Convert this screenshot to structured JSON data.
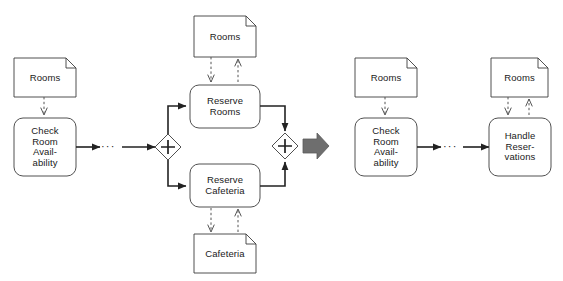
{
  "diagram": {
    "type": "bpmn-process-fragment",
    "title": "",
    "background_color": "#ffffff",
    "stroke_color": "#3c3c3c",
    "text_color": "#1a1a1a",
    "transition_arrow_color": "#6e6e6e",
    "panels": [
      {
        "id": "left-panel",
        "caption": ""
      },
      {
        "id": "right-panel",
        "caption": ""
      }
    ]
  },
  "left": {
    "documents": {
      "rooms_source": {
        "label": "Rooms",
        "name": "rooms-data-object"
      },
      "rooms_top": {
        "label": "Rooms",
        "name": "rooms-data-object"
      },
      "cafeteria_bottom": {
        "label": "Cafeteria",
        "name": "cafeteria-data-object"
      }
    },
    "tasks": {
      "check_room": {
        "label": "Check\nRoom\nAvail-\nability"
      },
      "reserve_rooms": {
        "label": "Reserve\nRooms"
      },
      "reserve_cafeteria": {
        "label": "Reserve\nCafeteria"
      }
    },
    "gateways": {
      "fork": {
        "symbol": "+",
        "kind": "parallel-fork"
      },
      "join": {
        "symbol": "+",
        "kind": "parallel-join"
      }
    },
    "ellipsis": {
      "label": "···"
    }
  },
  "right": {
    "documents": {
      "rooms_check": {
        "label": "Rooms",
        "name": "rooms-data-object"
      },
      "rooms_handle": {
        "label": "Rooms",
        "name": "rooms-data-object"
      }
    },
    "tasks": {
      "check_room": {
        "label": "Check\nRoom\nAvail-\nability"
      },
      "handle_reservations": {
        "label": "Handle\nReser-\nvations"
      }
    },
    "ellipsis": {
      "label": "···"
    }
  },
  "transition": {
    "label": "",
    "icon": "thick-right-arrow",
    "color": "#6e6e6e"
  }
}
